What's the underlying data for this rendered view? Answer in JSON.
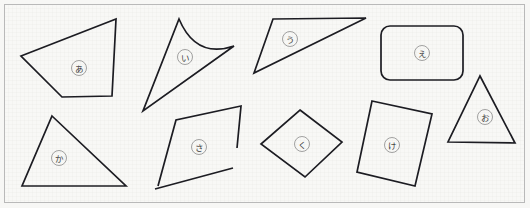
{
  "page": {
    "background_color": "#f7f7f5",
    "paper_color": "#f8f8f6",
    "border_color": "#b9b9b9",
    "stroke_color": "#1c1c22",
    "grid_color": "#e6e6e2",
    "label_ring_color": "#8a8a8a",
    "label_text_color": "#3a3a3a",
    "width": 530,
    "height": 208
  },
  "shapes": [
    {
      "id": "shape-a",
      "label": "あ",
      "label_romaji": "a",
      "kind": "quadrilateral",
      "closed": true,
      "curved": false,
      "points": "21,56 116,19 112,96 62,97",
      "label_x": 79,
      "label_y": 68,
      "label_r": 7.5
    },
    {
      "id": "shape-i",
      "label": "い",
      "label_romaji": "i",
      "kind": "curved-triangle",
      "closed": true,
      "curved": true,
      "path": "M 179,19 Q 196,59 234,46 L 143,111 Z",
      "label_x": 185,
      "label_y": 57,
      "label_r": 7.5
    },
    {
      "id": "shape-u",
      "label": "う",
      "label_romaji": "u",
      "kind": "triangle",
      "closed": true,
      "curved": false,
      "points": "273,19 366,18 254,73",
      "label_x": 290,
      "label_y": 39,
      "label_r": 7.5
    },
    {
      "id": "shape-e",
      "label": "え",
      "label_romaji": "e",
      "kind": "rounded-rectangle",
      "closed": true,
      "curved": true,
      "rect": {
        "x": 381,
        "y": 26,
        "width": 82,
        "height": 54,
        "rx": 9
      },
      "label_x": 422,
      "label_y": 53,
      "label_r": 7.5
    },
    {
      "id": "shape-o",
      "label": "お",
      "label_romaji": "o",
      "kind": "triangle",
      "closed": true,
      "curved": false,
      "points": "480,76 515,143 448,142",
      "label_x": 485,
      "label_y": 117,
      "label_r": 7.5
    },
    {
      "id": "shape-ka",
      "label": "か",
      "label_romaji": "ka",
      "kind": "triangle",
      "closed": true,
      "curved": false,
      "points": "52,116 126,186 22,186",
      "label_x": 59,
      "label_y": 158,
      "label_r": 7.5
    },
    {
      "id": "shape-sa",
      "label": "さ",
      "label_romaji": "sa",
      "kind": "open-quadrilateral",
      "closed": false,
      "curved": false,
      "path": "M 237,148 L 241,106 L 176,120 L 158,186 M 155,189 L 233,168",
      "label_x": 199,
      "label_y": 147,
      "label_r": 7.5
    },
    {
      "id": "shape-ku",
      "label": "く",
      "label_romaji": "ku",
      "kind": "rhombus",
      "closed": true,
      "curved": false,
      "points": "300,110 342,142 305,177 261,144",
      "label_x": 302,
      "label_y": 144,
      "label_r": 7.5
    },
    {
      "id": "shape-ke",
      "label": "け",
      "label_romaji": "ke",
      "kind": "rotated-rectangle",
      "closed": true,
      "curved": false,
      "points": "372,101 432,114 415,186 357,172",
      "label_x": 392,
      "label_y": 145,
      "label_r": 7.5
    }
  ]
}
